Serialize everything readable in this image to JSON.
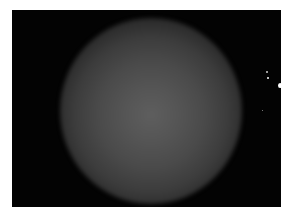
{
  "image": {
    "description": "Dark field image with a diffuse glowing grey sphere centered, and a few small bright points near the right edge",
    "background_color": "#030303",
    "border_color": "#ffffff",
    "sphere": {
      "center_color": "#5e5e5e",
      "edge_color": "#151515"
    },
    "bright_points": [
      {
        "x": 254,
        "y": 71,
        "size": 2
      },
      {
        "x": 255,
        "y": 77,
        "size": 2
      },
      {
        "x": 267,
        "y": 78,
        "size": 4
      },
      {
        "x": 250,
        "y": 98,
        "size": 1
      }
    ]
  }
}
